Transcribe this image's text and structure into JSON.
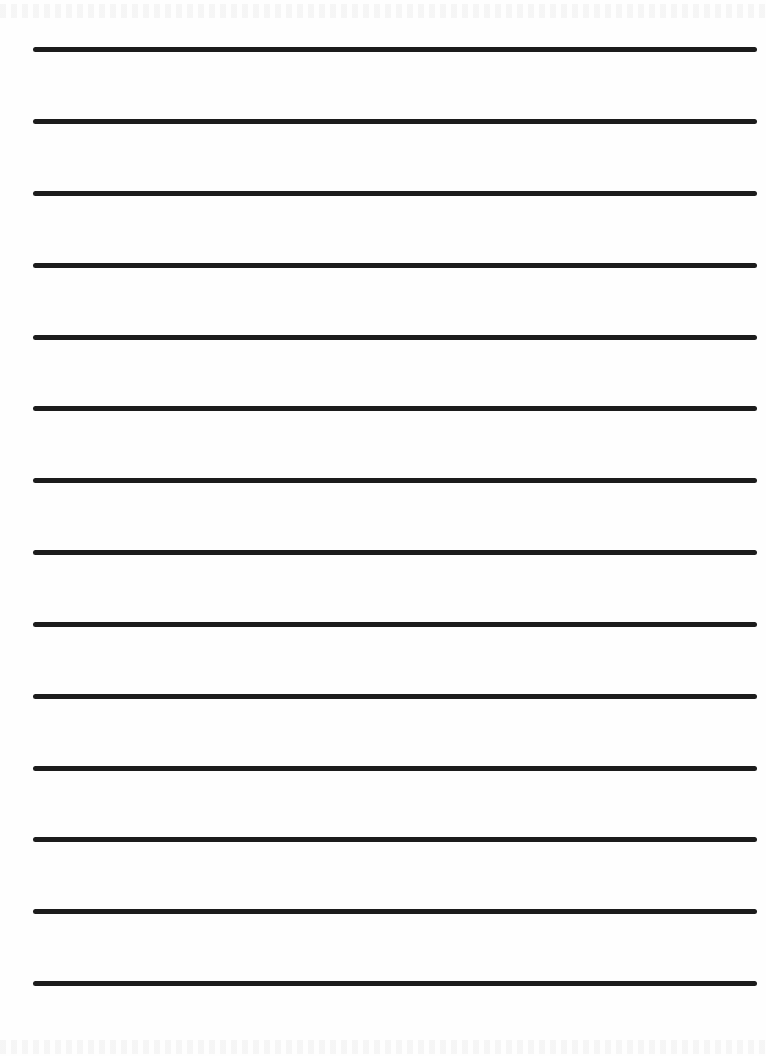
{
  "document": {
    "type": "lined-paper",
    "title": "",
    "line_count": 14,
    "colors": {
      "paper": "#fefefe",
      "rule": "#1c1c1c"
    },
    "rules": [
      {
        "y": 47
      },
      {
        "y": 119
      },
      {
        "y": 191
      },
      {
        "y": 263
      },
      {
        "y": 335
      },
      {
        "y": 406
      },
      {
        "y": 478
      },
      {
        "y": 550
      },
      {
        "y": 622
      },
      {
        "y": 694
      },
      {
        "y": 766
      },
      {
        "y": 837
      },
      {
        "y": 909
      },
      {
        "y": 981
      }
    ]
  }
}
